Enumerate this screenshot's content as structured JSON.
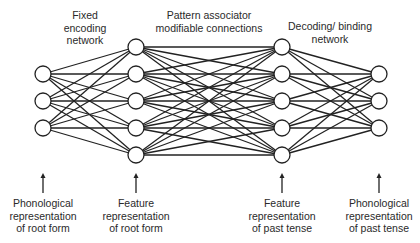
{
  "diagram": {
    "type": "neural-network",
    "top_labels": [
      {
        "id": "fixed-encoding",
        "x": 85,
        "y": 9,
        "lines": [
          "Fixed",
          "encoding",
          "network"
        ]
      },
      {
        "id": "pattern-associator",
        "x": 209,
        "y": 9,
        "lines": [
          "Pattern associator",
          "modifiable connections"
        ]
      },
      {
        "id": "decoding-binding",
        "x": 330,
        "y": 20,
        "lines": [
          "Decoding/ binding",
          "network"
        ]
      }
    ],
    "bottom_labels": [
      {
        "id": "phon-root",
        "x": 43,
        "y": 197,
        "lines": [
          "Phonological",
          "representation",
          "of root form"
        ]
      },
      {
        "id": "feat-root",
        "x": 136,
        "y": 197,
        "lines": [
          "Feature",
          "representation",
          "of root form"
        ]
      },
      {
        "id": "feat-past",
        "x": 282,
        "y": 197,
        "lines": [
          "Feature",
          "representation",
          "of past tense"
        ]
      },
      {
        "id": "phon-past",
        "x": 379,
        "y": 197,
        "lines": [
          "Phonological",
          "representation",
          "of past tense"
        ]
      }
    ],
    "layers": [
      {
        "name": "phonological-root-layer",
        "x": 43,
        "ys": [
          74,
          101,
          128
        ]
      },
      {
        "name": "feature-root-layer",
        "x": 136,
        "ys": [
          47,
          74,
          101,
          128,
          155
        ]
      },
      {
        "name": "feature-past-layer",
        "x": 282,
        "ys": [
          47,
          74,
          101,
          128,
          155
        ]
      },
      {
        "name": "phonological-past-layer",
        "x": 379,
        "ys": [
          74,
          101,
          128
        ]
      }
    ],
    "node_radius": 8,
    "arrows": [
      {
        "x": 43,
        "y1": 193,
        "y2": 173
      },
      {
        "x": 136,
        "y1": 193,
        "y2": 173
      },
      {
        "x": 282,
        "y1": 193,
        "y2": 173
      },
      {
        "x": 379,
        "y1": 193,
        "y2": 173
      }
    ],
    "colors": {
      "line": "#222222",
      "node_fill": "#ffffff",
      "text": "#2a2a2a"
    }
  }
}
